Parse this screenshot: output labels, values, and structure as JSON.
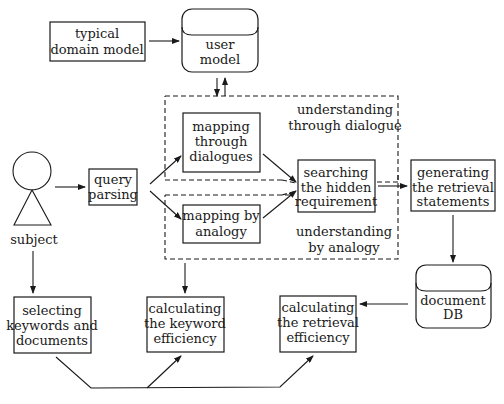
{
  "nodes": {
    "typical_domain_model": [
      "typical",
      "domain model"
    ],
    "user_model": [
      "user",
      "model"
    ],
    "subject": "subject",
    "query_parsing": [
      "query",
      "parsing"
    ],
    "mapping_through_dialogues": [
      "mapping",
      "through",
      "dialogues"
    ],
    "mapping_by_analogy": [
      "mapping by",
      "analogy"
    ],
    "searching_hidden_requirement": [
      "searching",
      "the hidden",
      "requirement"
    ],
    "generating_retrieval_statements": [
      "generating",
      "the retrieval",
      "statements"
    ],
    "document_db": [
      "document",
      "DB"
    ],
    "selecting_keywords": [
      "selecting",
      "keywords and",
      "documents"
    ],
    "calculating_keyword_efficiency": [
      "calculating",
      "the keyword",
      "efficiency"
    ],
    "calculating_retrieval_efficiency": [
      "calculating",
      "the retrieval",
      "efficiency"
    ]
  },
  "groups": {
    "understanding_dialogue": [
      "understanding",
      "through dialogue"
    ],
    "understanding_analogy": [
      "understanding",
      "by analogy"
    ]
  },
  "edges": [
    {
      "from": "typical_domain_model",
      "to": "user_model"
    },
    {
      "from": "user_model",
      "to": "understanding_dialogue"
    },
    {
      "from": "understanding_dialogue",
      "to": "user_model"
    },
    {
      "from": "subject",
      "to": "query_parsing"
    },
    {
      "from": "query_parsing",
      "to": "mapping_through_dialogues"
    },
    {
      "from": "query_parsing",
      "to": "mapping_by_analogy"
    },
    {
      "from": "mapping_through_dialogues",
      "to": "searching_hidden_requirement"
    },
    {
      "from": "mapping_by_analogy",
      "to": "searching_hidden_requirement"
    },
    {
      "from": "understanding_dialogue",
      "to": "searching_hidden_requirement",
      "style": "dashed"
    },
    {
      "from": "understanding_analogy",
      "to": "searching_hidden_requirement",
      "style": "dashed"
    },
    {
      "from": "searching_hidden_requirement",
      "to": "generating_retrieval_statements"
    },
    {
      "from": "generating_retrieval_statements",
      "to": "document_db"
    },
    {
      "from": "document_db",
      "to": "calculating_retrieval_efficiency"
    },
    {
      "from": "subject",
      "to": "selecting_keywords"
    },
    {
      "from": "understanding_analogy",
      "to": "calculating_keyword_efficiency"
    },
    {
      "from": "selecting_keywords",
      "to": "calculating_keyword_efficiency"
    },
    {
      "from": "selecting_keywords",
      "to": "calculating_retrieval_efficiency"
    }
  ]
}
